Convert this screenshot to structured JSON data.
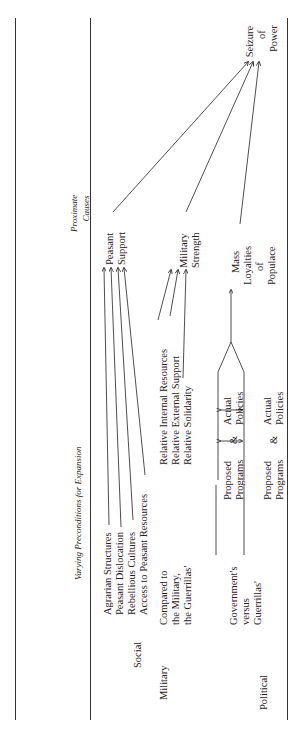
{
  "header": {
    "proximate_causes": [
      "Proximate",
      "Causes"
    ],
    "preconditions": "Varying Preconditions for Expansion"
  },
  "outcome": [
    "Seizure",
    "of",
    "Power"
  ],
  "categories": {
    "social": {
      "label": "Social",
      "preconditions": [
        "Agrarian Structures",
        "Peasant Dislocation",
        "Rebellious Cultures",
        "Access to Peasant Resources"
      ],
      "cause": [
        "Peasant",
        "Support"
      ]
    },
    "military": {
      "label": "Military",
      "qualifier": [
        "Compared to",
        "the Military,",
        "the Guerrillas'"
      ],
      "preconditions": [
        "Relative Internal Resources",
        "Relative External Support",
        "Relative Solidarity"
      ],
      "cause": [
        "Military",
        "Strength"
      ]
    },
    "political": {
      "label": "Political",
      "qualifier_gov": [
        "Government's",
        "versus"
      ],
      "qualifier_guer": "Guerrillas'",
      "gov_row": {
        "left": [
          "Proposed",
          "Programs"
        ],
        "amp": "&",
        "right": [
          "Actual",
          "Policies"
        ]
      },
      "guer_row": {
        "left": [
          "Proposed",
          "Programs"
        ],
        "amp": "&",
        "right": [
          "Actual",
          "Policies"
        ]
      },
      "cause": [
        "Mass",
        "Loyalties",
        "of",
        "Populace"
      ]
    }
  }
}
